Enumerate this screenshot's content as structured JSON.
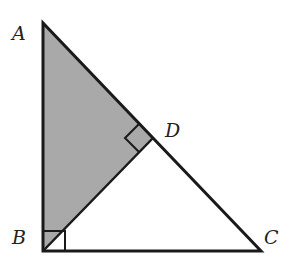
{
  "diagram": {
    "type": "geometry",
    "points": {
      "A": {
        "label": "A",
        "x": 43,
        "y": 23
      },
      "B": {
        "label": "B",
        "x": 43,
        "y": 251
      },
      "C": {
        "label": "C",
        "x": 261,
        "y": 251
      },
      "D": {
        "label": "D",
        "x": 153,
        "y": 138
      }
    },
    "labels": {
      "A": "A",
      "B": "B",
      "C": "C",
      "D": "D"
    },
    "shaded_region": "ABD",
    "right_angles": [
      "B",
      "D"
    ],
    "colors": {
      "stroke": "#1a1a1a",
      "shade": "#a9a9a9",
      "background": "#ffffff"
    }
  }
}
